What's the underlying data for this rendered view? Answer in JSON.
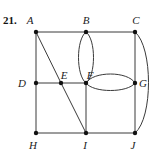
{
  "problem_number": "21.",
  "colors": {
    "edge": "#3a3a3a",
    "vertex": "#111111",
    "label": "#222222"
  },
  "vertices": [
    {
      "id": "A",
      "label": "A",
      "x": 36,
      "y": 32,
      "lx": 30,
      "ly": 24
    },
    {
      "id": "B",
      "label": "B",
      "x": 86,
      "y": 32,
      "lx": 86,
      "ly": 24
    },
    {
      "id": "C",
      "label": "C",
      "x": 135,
      "y": 32,
      "lx": 136,
      "ly": 24
    },
    {
      "id": "D",
      "label": "D",
      "x": 36,
      "y": 83,
      "lx": 22,
      "ly": 87
    },
    {
      "id": "E",
      "label": "E",
      "x": 61,
      "y": 83,
      "lx": 64,
      "ly": 79
    },
    {
      "id": "F",
      "label": "F",
      "x": 86,
      "y": 83,
      "lx": 90,
      "ly": 79
    },
    {
      "id": "G",
      "label": "G",
      "x": 135,
      "y": 83,
      "lx": 143,
      "ly": 87
    },
    {
      "id": "H",
      "label": "H",
      "x": 36,
      "y": 133,
      "lx": 33,
      "ly": 149
    },
    {
      "id": "I",
      "label": "I",
      "x": 86,
      "y": 133,
      "lx": 85,
      "ly": 149
    },
    {
      "id": "J",
      "label": "J",
      "x": 135,
      "y": 133,
      "lx": 133,
      "ly": 149
    }
  ],
  "edges": [
    {
      "from": "A",
      "to": "B",
      "shape": "line"
    },
    {
      "from": "B",
      "to": "C",
      "shape": "line"
    },
    {
      "from": "A",
      "to": "D",
      "shape": "line"
    },
    {
      "from": "D",
      "to": "H",
      "shape": "line"
    },
    {
      "from": "A",
      "to": "E",
      "shape": "line"
    },
    {
      "from": "E",
      "to": "I",
      "shape": "line"
    },
    {
      "from": "D",
      "to": "E",
      "shape": "line"
    },
    {
      "from": "E",
      "to": "F",
      "shape": "line"
    },
    {
      "from": "F",
      "to": "I",
      "shape": "line"
    },
    {
      "from": "H",
      "to": "I",
      "shape": "line"
    },
    {
      "from": "I",
      "to": "J",
      "shape": "line"
    },
    {
      "from": "C",
      "to": "G",
      "shape": "line"
    },
    {
      "from": "G",
      "to": "J",
      "shape": "line"
    },
    {
      "from": "B",
      "to": "F",
      "shape": "curve-left"
    },
    {
      "from": "B",
      "to": "F",
      "shape": "curve-right"
    },
    {
      "from": "F",
      "to": "G",
      "shape": "curve-up"
    },
    {
      "from": "F",
      "to": "G",
      "shape": "curve-down"
    },
    {
      "from": "C",
      "to": "J",
      "shape": "curve-right"
    }
  ]
}
